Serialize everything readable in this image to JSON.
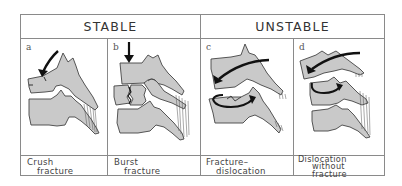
{
  "figure": {
    "groups": [
      {
        "label": "STABLE"
      },
      {
        "label": "UNSTABLE"
      }
    ],
    "panels": [
      {
        "letter": "a",
        "caption_line1": "Crush",
        "caption_line2": "fracture",
        "caption_line3": ""
      },
      {
        "letter": "b",
        "caption_line1": "Burst",
        "caption_line2": "fracture",
        "caption_line3": ""
      },
      {
        "letter": "c",
        "caption_line1": "Fracture–",
        "caption_line2": "dislocation",
        "caption_line3": ""
      },
      {
        "letter": "d",
        "caption_line1": "Dislocation",
        "caption_line2": "without",
        "caption_line3": "fracture"
      }
    ],
    "colors": {
      "bone_fill": "#c9c9c9",
      "outline": "#444444",
      "arrow": "#1a1a1a",
      "border": "#8a8a8a"
    }
  }
}
